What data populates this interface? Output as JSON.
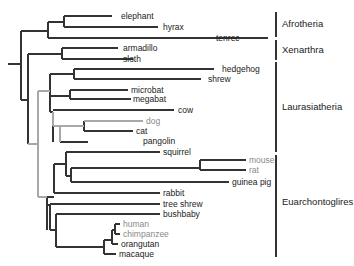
{
  "figure": {
    "type": "phylogenetic-tree",
    "colors": {
      "branch": "#333333",
      "highlight_branch": "#a8a8a8",
      "gray_label": "#8a8a8a",
      "label": "#222222"
    }
  },
  "taxa": [
    {
      "name": "elephant",
      "y": 16,
      "x_end": 118,
      "gray": false
    },
    {
      "name": "hyrax",
      "y": 27,
      "x_end": 160,
      "gray": false
    },
    {
      "name": "tenrec",
      "y": 38,
      "x_end": 213,
      "gray": false
    },
    {
      "name": "armadillo",
      "y": 48,
      "x_end": 120,
      "gray": false
    },
    {
      "name": "sloth",
      "y": 59,
      "x_end": 120,
      "gray": false
    },
    {
      "name": "hedgehog",
      "y": 69,
      "x_end": 219,
      "gray": false
    },
    {
      "name": "shrew",
      "y": 79,
      "x_end": 205,
      "gray": false
    },
    {
      "name": "microbat",
      "y": 90,
      "x_end": 128,
      "gray": false
    },
    {
      "name": "megabat",
      "y": 99,
      "x_end": 130,
      "gray": false
    },
    {
      "name": "cow",
      "y": 110,
      "x_end": 175,
      "gray": false
    },
    {
      "name": "dog",
      "y": 121,
      "x_end": 143,
      "gray": true
    },
    {
      "name": "cat",
      "y": 131,
      "x_end": 133,
      "gray": false
    },
    {
      "name": "pangolin",
      "y": 141,
      "x_end": 140,
      "gray": false
    },
    {
      "name": "squirrel",
      "y": 152,
      "x_end": 160,
      "gray": false
    },
    {
      "name": "mouse",
      "y": 160,
      "x_end": 246,
      "gray": true
    },
    {
      "name": "rat",
      "y": 170,
      "x_end": 246,
      "gray": true
    },
    {
      "name": "guinea pig",
      "y": 182,
      "x_end": 229,
      "gray": false
    },
    {
      "name": "rabbit",
      "y": 193,
      "x_end": 160,
      "gray": false
    },
    {
      "name": "tree shrew",
      "y": 204,
      "x_end": 160,
      "gray": false
    },
    {
      "name": "bushbaby",
      "y": 214,
      "x_end": 160,
      "gray": false
    },
    {
      "name": "human",
      "y": 224,
      "x_end": 120,
      "gray": true
    },
    {
      "name": "chimpanzee",
      "y": 234,
      "x_end": 120,
      "gray": true
    },
    {
      "name": "orangutan",
      "y": 244,
      "x_end": 118,
      "gray": false
    },
    {
      "name": "macaque",
      "y": 254,
      "x_end": 116,
      "gray": false
    }
  ],
  "clades": [
    {
      "name": "Afrotheria",
      "y1": 12,
      "y2": 37,
      "label_y": 27
    },
    {
      "name": "Xenarthra",
      "y1": 40,
      "y2": 60,
      "label_y": 53
    },
    {
      "name": "Laurasiatheria",
      "y1": 62,
      "y2": 152,
      "label_y": 110
    },
    {
      "name": "Euarchontoglires",
      "y1": 155,
      "y2": 257,
      "label_y": 205
    }
  ]
}
